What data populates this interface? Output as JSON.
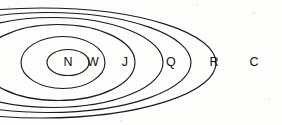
{
  "diagram": {
    "type": "euler-nested-ellipses",
    "background_color": "#fdfdfc",
    "stroke_color": "#1a1a1a",
    "label_color": "#101010",
    "canvas": {
      "width": 282,
      "height": 125
    },
    "sets": [
      {
        "id": "n",
        "label": "N",
        "name": "innermost-ellipse",
        "cx": 68,
        "cy": 62.5,
        "rx": 21,
        "ry": 13,
        "label_x": 68,
        "label_y": 62.5
      },
      {
        "id": "w",
        "label": "W",
        "name": "second-ellipse",
        "cx": 63,
        "cy": 62.5,
        "rx": 42,
        "ry": 26,
        "label_x": 93,
        "label_y": 62.5
      },
      {
        "id": "j",
        "label": "J",
        "name": "third-ellipse",
        "cx": 58,
        "cy": 62.5,
        "rx": 77,
        "ry": 38,
        "label_x": 125,
        "label_y": 62.5
      },
      {
        "id": "q",
        "label": "Q",
        "name": "fourth-ellipse",
        "cx": 53,
        "cy": 62.5,
        "rx": 110,
        "ry": 45,
        "label_x": 171,
        "label_y": 62.5
      },
      {
        "id": "r",
        "label": "R",
        "name": "fifth-ellipse",
        "cx": 48,
        "cy": 62.5,
        "rx": 143,
        "ry": 50,
        "label_x": 214,
        "label_y": 62.5
      },
      {
        "id": "c",
        "label": "C",
        "name": "outermost-ellipse",
        "cx": 42,
        "cy": 63,
        "rx": 174,
        "ry": 55,
        "label_x": 254,
        "label_y": 62.5
      }
    ]
  }
}
